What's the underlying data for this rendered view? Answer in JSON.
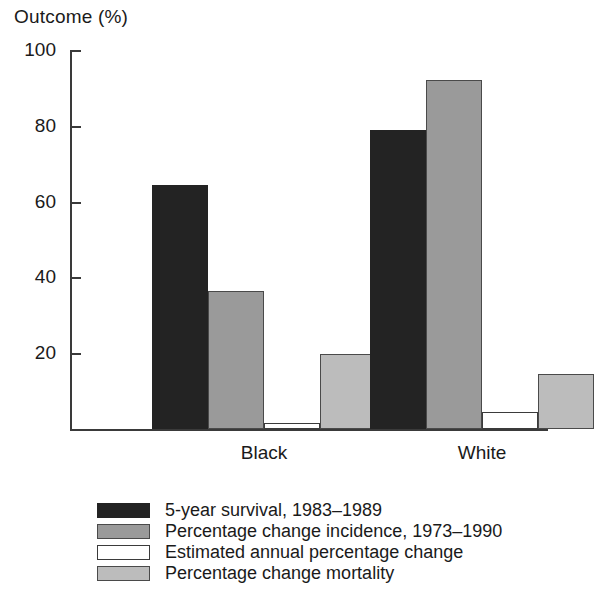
{
  "chart_data": {
    "type": "bar",
    "title": "Outcome (%)",
    "xlabel": "",
    "ylabel": "Outcome (%)",
    "ylim": [
      0,
      100
    ],
    "yticks": [
      100,
      80,
      60,
      40,
      20
    ],
    "grid": false,
    "legend_position": "bottom",
    "categories": [
      "Black",
      "White"
    ],
    "series": [
      {
        "name": "5-year survival, 1983–1989",
        "color": "#232323",
        "values": [
          64.5,
          79.0
        ]
      },
      {
        "name": "Percentage change incidence, 1973–1990",
        "color": "#9a9a9a",
        "values": [
          36.3,
          92.0
        ]
      },
      {
        "name": "Estimated annual percentage change",
        "color": "#ffffff",
        "values": [
          1.5,
          4.5
        ]
      },
      {
        "name": "Percentage change mortality",
        "color": "#bcbcbc",
        "values": [
          19.7,
          14.5
        ]
      }
    ]
  },
  "axis": {
    "title": "Outcome (%)",
    "tick_labels": [
      "100",
      "80",
      "60",
      "40",
      "20"
    ]
  },
  "categories": [
    {
      "label": "Black"
    },
    {
      "label": "White"
    }
  ],
  "legend": {
    "items": [
      {
        "label": "5-year survival, 1983–1989"
      },
      {
        "label": "Percentage change incidence, 1973–1990"
      },
      {
        "label": "Estimated annual percentage change"
      },
      {
        "label": "Percentage change mortality"
      }
    ]
  }
}
